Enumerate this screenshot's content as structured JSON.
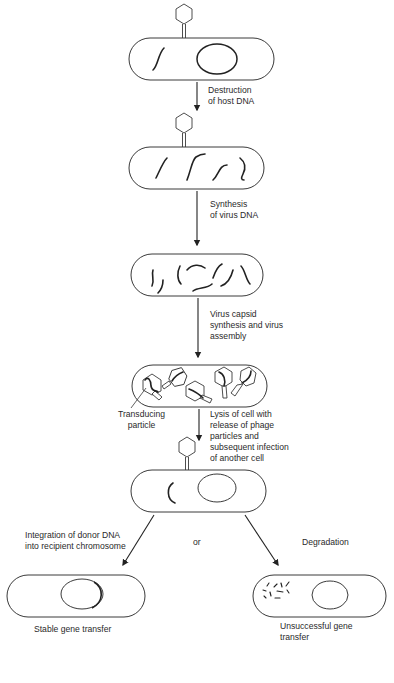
{
  "diagram": {
    "type": "process-flow",
    "topic": "Generalized transduction by bacteriophage",
    "steps": [
      {
        "id": "infection",
        "description": "Phage attached to host cell containing host DNA and chromosome"
      },
      {
        "id": "host-dna-fragments",
        "description": "Host DNA fragmented"
      },
      {
        "id": "virus-dna",
        "description": "Virus DNA synthesized"
      },
      {
        "id": "assembly",
        "description": "Phage particles assembled, including a transducing particle"
      },
      {
        "id": "recipient",
        "description": "Phage injects donor DNA into another cell"
      },
      {
        "id": "stable",
        "description": "Donor DNA integrated into recipient chromosome"
      },
      {
        "id": "unsuccessful",
        "description": "Donor DNA degraded"
      }
    ],
    "labels": {
      "step1": "Destruction\nof host DNA",
      "step2": "Synthesis\nof virus DNA",
      "step3": "Virus capsid\nsynthesis and virus\nassembly",
      "transducing": "Transducing\nparticle",
      "step4": "Lysis of cell with\nrelease of phage\nparticles and\nsubsequent infection\nof another cell",
      "integration": "Integration of donor DNA\ninto recipient chromosome",
      "or": "or",
      "degradation": "Degradation",
      "stable": "Stable gene transfer",
      "unsuccessful": "Unsuccessful gene\ntransfer"
    }
  }
}
